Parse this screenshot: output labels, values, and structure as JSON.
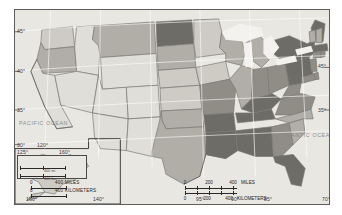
{
  "map": {
    "title": "United States choropleth map",
    "projection_note": "Conterminous United States with Alaska and Hawaii insets",
    "background_color": "#e9e7e2",
    "border_color": "#5d5d5d",
    "shade_levels": [
      "#e0ded8",
      "#cdcbc4",
      "#b0aea7",
      "#8f8d86",
      "#6e6c66"
    ],
    "ocean_labels": [
      {
        "text": "PACIFIC OCEAN",
        "left": 18,
        "top": 120
      },
      {
        "text": "ATLANTIC OCEAN",
        "left": 281,
        "top": 132
      }
    ],
    "latitude_labels_left": [
      {
        "text": "45°",
        "top": 28
      },
      {
        "text": "40°",
        "top": 68
      },
      {
        "text": "35°",
        "top": 107
      },
      {
        "text": "30°",
        "top": 142
      }
    ],
    "latitude_labels_right": [
      {
        "text": "45°",
        "top": 64
      },
      {
        "text": "35°",
        "top": 108
      }
    ],
    "longitude_labels_inline": [
      {
        "text": "120°",
        "left": 36,
        "top": 142
      },
      {
        "text": "125°",
        "left": 16,
        "top": 149
      },
      {
        "text": "160°",
        "left": 55,
        "top": 149
      }
    ],
    "longitude_labels_bottom": [
      {
        "text": "160°",
        "left": 26
      },
      {
        "text": "140°",
        "left": 93
      },
      {
        "text": "95°",
        "left": 196
      },
      {
        "text": "90°",
        "left": 231
      },
      {
        "text": "85°",
        "left": 264
      },
      {
        "text": "70°",
        "left": 322
      }
    ],
    "main_scale": {
      "ticks_miles": [
        "0",
        "200",
        "400"
      ],
      "unit_miles": "MILES",
      "ticks_km": [
        "0",
        "200",
        "400"
      ],
      "unit_km": "KILOMETERS"
    },
    "alaska_scale": {
      "ticks_miles": [
        "0"
      ],
      "label_miles": "400 MILES",
      "ticks_km": [
        "0"
      ],
      "label_km": "400 KILOMETERS"
    },
    "hawaii_scale": {
      "label_miles": "400 mi.",
      "label_km": "400 km."
    },
    "insets": [
      {
        "name": "hawaii-inset",
        "label": "Hawaii"
      },
      {
        "name": "alaska-inset",
        "label": "Alaska"
      }
    ],
    "states": [
      {
        "code": "WA",
        "name": "Washington",
        "level": 1
      },
      {
        "code": "OR",
        "name": "Oregon",
        "level": 2
      },
      {
        "code": "CA",
        "name": "California",
        "level": 0
      },
      {
        "code": "ID",
        "name": "Idaho",
        "level": 0
      },
      {
        "code": "NV",
        "name": "Nevada",
        "level": 0
      },
      {
        "code": "MT",
        "name": "Montana",
        "level": 2
      },
      {
        "code": "WY",
        "name": "Wyoming",
        "level": 0
      },
      {
        "code": "UT",
        "name": "Utah",
        "level": 0
      },
      {
        "code": "AZ",
        "name": "Arizona",
        "level": 0
      },
      {
        "code": "CO",
        "name": "Colorado",
        "level": 0
      },
      {
        "code": "NM",
        "name": "New Mexico",
        "level": 0
      },
      {
        "code": "ND",
        "name": "North Dakota",
        "level": 4
      },
      {
        "code": "SD",
        "name": "South Dakota",
        "level": 2
      },
      {
        "code": "NE",
        "name": "Nebraska",
        "level": 1
      },
      {
        "code": "KS",
        "name": "Kansas",
        "level": 1
      },
      {
        "code": "OK",
        "name": "Oklahoma",
        "level": 2
      },
      {
        "code": "TX",
        "name": "Texas",
        "level": 2
      },
      {
        "code": "MN",
        "name": "Minnesota",
        "level": 1
      },
      {
        "code": "IA",
        "name": "Iowa",
        "level": 1
      },
      {
        "code": "MO",
        "name": "Missouri",
        "level": 3
      },
      {
        "code": "AR",
        "name": "Arkansas",
        "level": 4
      },
      {
        "code": "LA",
        "name": "Louisiana",
        "level": 4
      },
      {
        "code": "WI",
        "name": "Wisconsin",
        "level": 2
      },
      {
        "code": "IL",
        "name": "Illinois",
        "level": 2
      },
      {
        "code": "MI",
        "name": "Michigan",
        "level": 2
      },
      {
        "code": "IN",
        "name": "Indiana",
        "level": 3
      },
      {
        "code": "OH",
        "name": "Ohio",
        "level": 3
      },
      {
        "code": "KY",
        "name": "Kentucky",
        "level": 4
      },
      {
        "code": "TN",
        "name": "Tennessee",
        "level": 4
      },
      {
        "code": "MS",
        "name": "Mississippi",
        "level": 4
      },
      {
        "code": "AL",
        "name": "Alabama",
        "level": 4
      },
      {
        "code": "GA",
        "name": "Georgia",
        "level": 3
      },
      {
        "code": "FL",
        "name": "Florida",
        "level": 4
      },
      {
        "code": "SC",
        "name": "South Carolina",
        "level": 2
      },
      {
        "code": "NC",
        "name": "North Carolina",
        "level": 2
      },
      {
        "code": "VA",
        "name": "Virginia",
        "level": 3
      },
      {
        "code": "WV",
        "name": "West Virginia",
        "level": 3
      },
      {
        "code": "PA",
        "name": "Pennsylvania",
        "level": 4
      },
      {
        "code": "NY",
        "name": "New York",
        "level": 4
      },
      {
        "code": "ME",
        "name": "Maine",
        "level": 4
      },
      {
        "code": "VT",
        "name": "Vermont",
        "level": 2
      },
      {
        "code": "NH",
        "name": "New Hampshire",
        "level": 2
      },
      {
        "code": "MA",
        "name": "Massachusetts",
        "level": 4
      },
      {
        "code": "CT",
        "name": "Connecticut",
        "level": 3
      },
      {
        "code": "RI",
        "name": "Rhode Island",
        "level": 3
      },
      {
        "code": "NJ",
        "name": "New Jersey",
        "level": 3
      },
      {
        "code": "DE",
        "name": "Delaware",
        "level": 3
      },
      {
        "code": "MD",
        "name": "Maryland",
        "level": 3
      },
      {
        "code": "AK",
        "name": "Alaska",
        "level": 1
      },
      {
        "code": "HI",
        "name": "Hawaii",
        "level": 1
      }
    ]
  }
}
